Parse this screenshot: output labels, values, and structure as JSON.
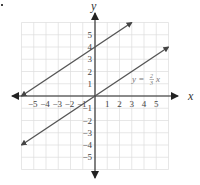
{
  "chart_data": {
    "type": "line",
    "title": "",
    "xlabel": "x",
    "ylabel": "y",
    "xlim": [
      -6,
      6
    ],
    "ylim": [
      -6,
      6
    ],
    "grid": true,
    "x_ticks": [
      -5,
      -4,
      -3,
      -2,
      -1,
      1,
      2,
      3,
      4,
      5
    ],
    "y_ticks": [
      5,
      4,
      3,
      2,
      1,
      -1,
      -2,
      -3,
      -4,
      -5
    ],
    "x_tick_labels": [
      "−5",
      "−4",
      "−3",
      "−2",
      "−1",
      "1",
      "2",
      "3",
      "4",
      "5"
    ],
    "y_tick_labels": [
      "5",
      "4",
      "3",
      "2",
      "1",
      "−1",
      "−2",
      "−3",
      "−4",
      "−5"
    ],
    "series": [
      {
        "name": "y = (2/3)x + 4",
        "points": [
          [
            -6,
            0
          ],
          [
            3,
            6
          ]
        ],
        "arrows": "both",
        "color": "#555555"
      },
      {
        "name": "y = (2/3)x",
        "points": [
          [
            -6,
            -4
          ],
          [
            6,
            4
          ]
        ],
        "arrows": "both",
        "color": "#555555"
      }
    ],
    "annotations": [
      {
        "text_prefix": "y = ",
        "frac_num": "2",
        "frac_den": "3",
        "text_suffix": "x",
        "at": [
          3.4,
          1.4
        ]
      }
    ]
  },
  "labels": {
    "x_axis": "x",
    "y_axis": "y",
    "equation_prefix": "y = ",
    "equation_num": "2",
    "equation_den": "3",
    "equation_var": "x"
  }
}
